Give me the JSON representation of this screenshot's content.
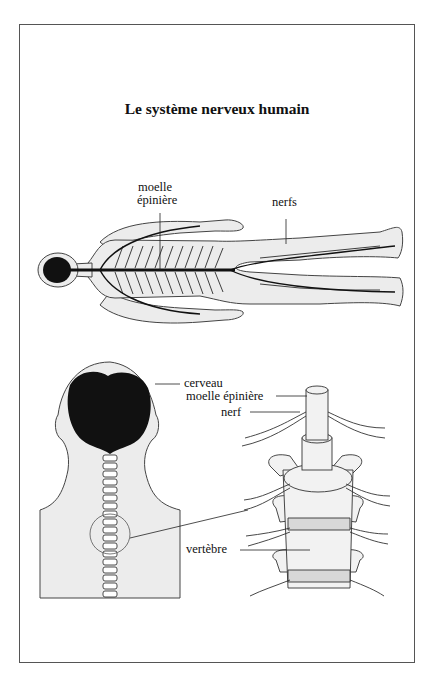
{
  "diagram": {
    "title": "Le système nerveux humain",
    "colors": {
      "tissue_fill": "#ececec",
      "outline": "#444444",
      "nerve": "#111111",
      "frame": "#555555"
    },
    "full_body": {
      "labels": {
        "spinal_cord_line1": "moelle",
        "spinal_cord_line2": "épinière",
        "nerves": "nerfs"
      }
    },
    "head_and_spine": {
      "labels": {
        "brain": "cerveau",
        "spinal_cord": "moelle épinière",
        "nerve": "nerf",
        "vertebra": "vertèbre"
      }
    }
  }
}
